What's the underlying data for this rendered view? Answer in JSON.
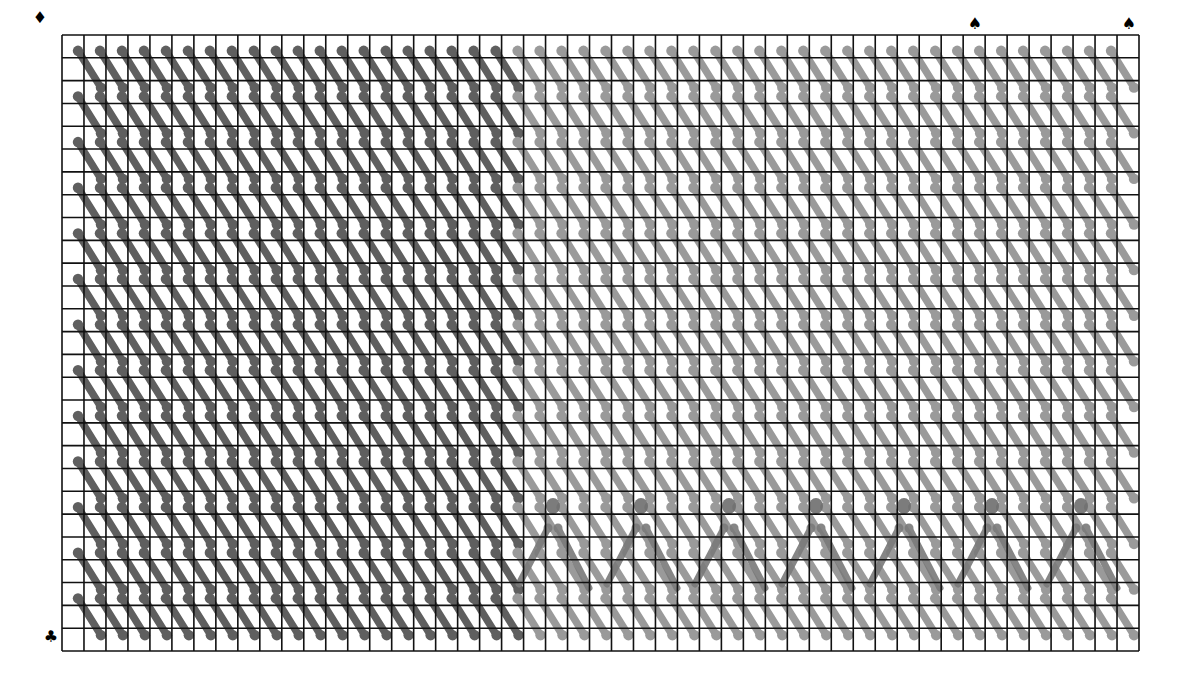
{
  "diagram": {
    "type": "stitch-chart",
    "grid": {
      "left": 62,
      "top": 35,
      "width": 1077,
      "height": 616,
      "columns": 49,
      "rows": 27,
      "line_color": "#111111",
      "line_width": 1.6,
      "background": "#ffffff"
    },
    "regions": [
      {
        "name": "dark-stitch-region",
        "col_start": 0,
        "col_end": 19,
        "color": "#5f5f5f"
      },
      {
        "name": "light-stitch-region",
        "col_start": 20,
        "col_end": 48,
        "color": "#9a9a9a"
      }
    ],
    "stitch": {
      "pattern": "diagonal-backstitch",
      "row_parity": 1,
      "stroke_width": 7.5,
      "end_dot_radius": 5.2
    },
    "overlays": {
      "name": "a-shape-motifs",
      "color": "#7a7a7a",
      "top_dot_radius": 7,
      "items": [
        {
          "top": [
            553,
            506
          ],
          "left_foot": [
            519,
            584
          ],
          "right_foot": [
            589,
            588
          ]
        },
        {
          "top": [
            641,
            506
          ],
          "left_foot": [
            607,
            584
          ],
          "right_foot": [
            677,
            588
          ]
        },
        {
          "top": [
            729,
            506
          ],
          "left_foot": [
            695,
            584
          ],
          "right_foot": [
            765,
            588
          ]
        },
        {
          "top": [
            816,
            506
          ],
          "left_foot": [
            782,
            584
          ],
          "right_foot": [
            852,
            588
          ]
        },
        {
          "top": [
            904,
            506
          ],
          "left_foot": [
            870,
            584
          ],
          "right_foot": [
            940,
            588
          ]
        },
        {
          "top": [
            992,
            506
          ],
          "left_foot": [
            958,
            584
          ],
          "right_foot": [
            1028,
            588
          ]
        },
        {
          "top": [
            1081,
            506
          ],
          "left_foot": [
            1047,
            584
          ],
          "right_foot": [
            1117,
            588
          ]
        }
      ]
    },
    "markers": [
      {
        "name": "diamond-marker",
        "glyph": "♦",
        "x": 40,
        "y": 18
      },
      {
        "name": "club-marker",
        "glyph": "♣",
        "x": 51,
        "y": 637
      },
      {
        "name": "spade-marker-1",
        "glyph": "♠",
        "x": 975,
        "y": 24
      },
      {
        "name": "spade-marker-2",
        "glyph": "♠",
        "x": 1129,
        "y": 24
      }
    ]
  }
}
